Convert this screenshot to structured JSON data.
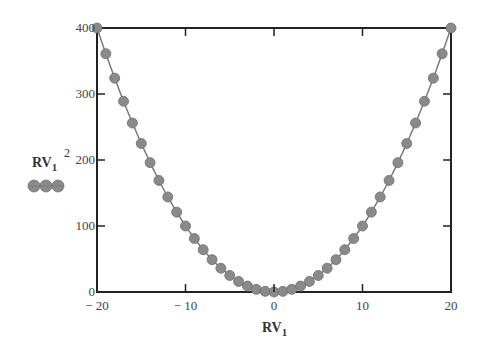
{
  "chart_data": {
    "type": "line",
    "title": "",
    "xlabel": "RV1",
    "ylabel": "RV1^2",
    "xlabel_main": "RV",
    "xlabel_sub": "1",
    "ylabel_main": "RV",
    "ylabel_sub": "1",
    "ylabel_sup": "2",
    "xlim": [
      -20,
      20
    ],
    "ylim": [
      0,
      400
    ],
    "x_ticks": [
      -20,
      -10,
      0,
      10,
      20
    ],
    "x_tick_labels": [
      "− 20",
      "− 10",
      "0",
      "10",
      "20"
    ],
    "y_ticks": [
      0,
      100,
      200,
      300,
      400
    ],
    "y_tick_labels": [
      "0",
      "100",
      "200",
      "300",
      "400"
    ],
    "grid": false,
    "legend": {
      "position": "left",
      "entries": [
        "RV1^2"
      ]
    },
    "series": [
      {
        "name": "RV1^2",
        "marker": "circle",
        "color": "#8a8a8a",
        "x": [
          -20,
          -19,
          -18,
          -17,
          -16,
          -15,
          -14,
          -13,
          -12,
          -11,
          -10,
          -9,
          -8,
          -7,
          -6,
          -5,
          -4,
          -3,
          -2,
          -1,
          0,
          1,
          2,
          3,
          4,
          5,
          6,
          7,
          8,
          9,
          10,
          11,
          12,
          13,
          14,
          15,
          16,
          17,
          18,
          19,
          20
        ],
        "values": [
          400,
          361,
          324,
          289,
          256,
          225,
          196,
          169,
          144,
          121,
          100,
          81,
          64,
          49,
          36,
          25,
          16,
          9,
          4,
          1,
          0,
          1,
          4,
          9,
          16,
          25,
          36,
          49,
          64,
          81,
          100,
          121,
          144,
          169,
          196,
          225,
          256,
          289,
          324,
          361,
          400
        ]
      }
    ]
  }
}
